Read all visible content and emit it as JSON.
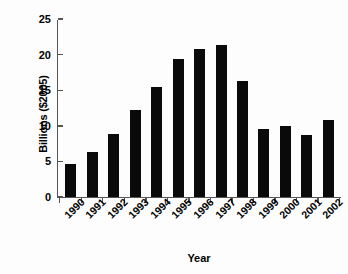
{
  "chart_data": {
    "type": "bar",
    "title": "",
    "xlabel": "Year",
    "ylabel": "Billions ($2005)",
    "categories": [
      "1990",
      "1991",
      "1992",
      "1993",
      "1994",
      "1995",
      "1996",
      "1997",
      "1998",
      "1999",
      "2000",
      "2001",
      "2002"
    ],
    "values": [
      4.6,
      6.3,
      8.9,
      12.2,
      15.4,
      19.4,
      20.8,
      21.4,
      16.3,
      9.6,
      10.0,
      8.7,
      10.8
    ],
    "series": [
      {
        "name": "Billions ($2005)",
        "values": [
          4.6,
          6.3,
          8.9,
          12.2,
          15.4,
          19.4,
          20.8,
          21.4,
          16.3,
          9.6,
          10.0,
          8.7,
          10.8
        ]
      }
    ],
    "ylim": [
      0,
      25
    ],
    "yticks": [
      0,
      5,
      10,
      15,
      20,
      25
    ],
    "ytick_labels": [
      "0",
      "5",
      "10",
      "15",
      "20",
      "25"
    ],
    "grid": false,
    "legend": false,
    "bar_color": "#0a0a0a",
    "axis_color": "#555555",
    "background_color": "#fdfdfd",
    "xtick_rotation": -45
  }
}
